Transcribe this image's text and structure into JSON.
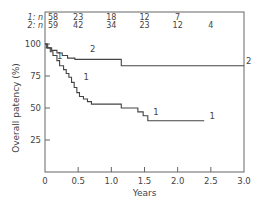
{
  "chart_data": {
    "type": "line",
    "subtype": "kaplan-meier step",
    "title": "",
    "xlabel": "Years",
    "ylabel": "Overall patency (%)",
    "xlim": [
      0,
      3.0
    ],
    "ylim": [
      0,
      100
    ],
    "x_ticks": [
      "0",
      "0.5",
      "1.0",
      "1.5",
      "2.0",
      "2.5",
      "3.0"
    ],
    "y_ticks": [
      "25",
      "50",
      "75",
      "100"
    ],
    "grid": false,
    "legend": "inline curve labels '1' and '2'",
    "risk_table": {
      "rows": [
        {
          "label": "1: n",
          "values": [
            "58",
            "23",
            "18",
            "12",
            "7",
            ""
          ]
        },
        {
          "label": "2: n",
          "values": [
            "59",
            "42",
            "34",
            "23",
            "12",
            "4"
          ]
        }
      ],
      "at_years": [
        0,
        0.5,
        1.0,
        1.5,
        2.0,
        2.5
      ]
    },
    "series": [
      {
        "name": "1",
        "points": [
          [
            0,
            100
          ],
          [
            0.02,
            97
          ],
          [
            0.08,
            94
          ],
          [
            0.12,
            91
          ],
          [
            0.18,
            87
          ],
          [
            0.22,
            83
          ],
          [
            0.28,
            80
          ],
          [
            0.32,
            77
          ],
          [
            0.36,
            74
          ],
          [
            0.4,
            70
          ],
          [
            0.44,
            66
          ],
          [
            0.48,
            62
          ],
          [
            0.52,
            59
          ],
          [
            0.58,
            57
          ],
          [
            0.64,
            55
          ],
          [
            0.7,
            53
          ],
          [
            1.15,
            50
          ],
          [
            1.4,
            47
          ],
          [
            1.48,
            44
          ],
          [
            1.55,
            40
          ],
          [
            2.4,
            40
          ]
        ]
      },
      {
        "name": "2",
        "points": [
          [
            0,
            100
          ],
          [
            0.04,
            97
          ],
          [
            0.1,
            95
          ],
          [
            0.18,
            93
          ],
          [
            0.26,
            91
          ],
          [
            0.34,
            89
          ],
          [
            0.45,
            88
          ],
          [
            1.15,
            83
          ],
          [
            3.0,
            83
          ]
        ]
      }
    ],
    "annotations": [
      {
        "text": "1",
        "x": 0.15,
        "y": 87
      },
      {
        "text": "1",
        "x": 0.55,
        "y": 70
      },
      {
        "text": "1",
        "x": 1.6,
        "y": 43
      },
      {
        "text": "1",
        "x": 2.45,
        "y": 40
      },
      {
        "text": "2",
        "x": 0.65,
        "y": 92
      },
      {
        "text": "2",
        "x": 3.0,
        "y": 83
      }
    ]
  }
}
